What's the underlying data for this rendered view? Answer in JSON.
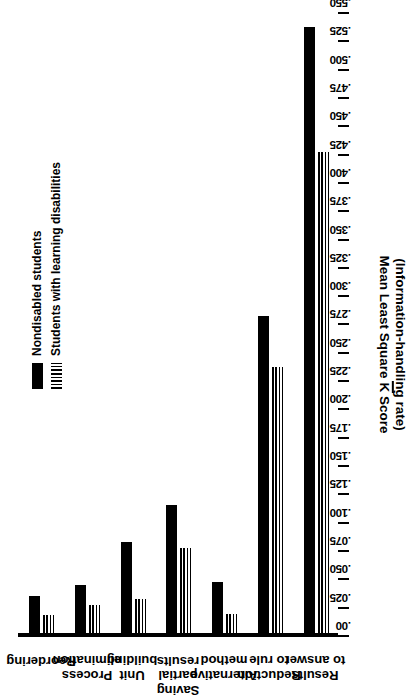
{
  "chart_data": {
    "type": "bar",
    "orientation": "horizontal",
    "title": "",
    "xlabel": "",
    "ylabel": "Mean Least Square K Score (Information-handling rate)",
    "axis_title_line1": "Mean Least Square K Score",
    "axis_title_line2": "(Information-handling rate)",
    "axis_title_kbar": "K",
    "value_axis_range": [
      0.0,
      0.55
    ],
    "value_axis_tick_step": 0.025,
    "tick_labels": [
      ".550",
      ".525",
      ".500",
      ".475",
      ".450",
      ".425",
      ".400",
      ".375",
      ".350",
      ".325",
      ".300",
      ".275",
      ".250",
      ".225",
      ".200",
      ".175",
      ".150",
      ".125",
      ".100",
      ".075",
      ".050",
      ".025",
      ".00"
    ],
    "tick_values": [
      0.55,
      0.525,
      0.5,
      0.475,
      0.45,
      0.425,
      0.4,
      0.375,
      0.35,
      0.325,
      0.3,
      0.275,
      0.25,
      0.225,
      0.2,
      0.175,
      0.15,
      0.125,
      0.1,
      0.075,
      0.05,
      0.025,
      0.0
    ],
    "grid": false,
    "legend_position": "top-left",
    "categories": [
      "Results\nto answer",
      "Reduction\nto rule",
      "Alternative\nmethod",
      "Saving\npartial\nresults",
      "Unit\nbuilding",
      "Process\nelimination",
      "Reordering"
    ],
    "series": [
      {
        "name": "Nondisabled students",
        "style": "solid",
        "color": "#000000",
        "values": [
          0.535,
          0.28,
          0.045,
          0.113,
          0.08,
          0.042,
          0.033
        ]
      },
      {
        "name": "Students with learning disabilities",
        "style": "hatched",
        "color": "#000000",
        "values": [
          0.425,
          0.235,
          0.017,
          0.075,
          0.03,
          0.025,
          0.016
        ]
      }
    ]
  },
  "legend": {
    "items": [
      {
        "label": "Nondisabled students",
        "style": "solid"
      },
      {
        "label": "Students with learning disabilities",
        "style": "hatched"
      }
    ]
  }
}
